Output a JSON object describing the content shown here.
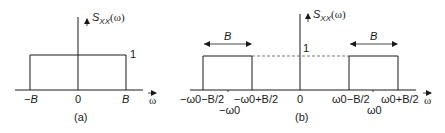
{
  "diagram": {
    "panel_a": {
      "caption": "(a)",
      "y_axis_label_main": "S",
      "y_axis_label_sub": "XX",
      "y_axis_label_arg": "(ω)",
      "level_label": "1",
      "x_axis_label": "ω",
      "ticks": [
        "−B",
        "0",
        "B"
      ]
    },
    "panel_b": {
      "caption": "(b)",
      "y_axis_label_main": "S",
      "y_axis_label_sub": "XX",
      "y_axis_label_arg": "(ω)",
      "level_label": "1",
      "x_axis_label": "ω",
      "bandwidth_label_left": "B",
      "bandwidth_label_right": "B",
      "ticks": {
        "left_outer": "−ω0−B/2",
        "left_center": "−ω0",
        "left_inner": "−ω0+B/2",
        "zero": "0",
        "right_inner": "ω0−B/2",
        "right_center": "ω0",
        "right_outer": "ω0+B/2"
      }
    },
    "colors": {
      "line": "#1a1a1a",
      "dashed": "#555555",
      "background": "#ffffff"
    }
  }
}
